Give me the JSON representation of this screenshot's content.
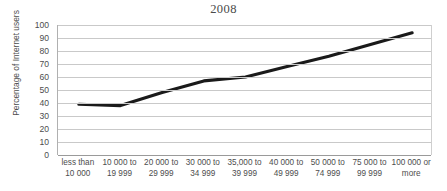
{
  "chart_data": {
    "type": "line",
    "title": "2008",
    "xlabel": "",
    "ylabel": "Percentage of Internet users",
    "categories": [
      "less than\n10 000",
      "10 000 to\n19 999",
      "20 000 to\n29 999",
      "30 000 to\n34 999",
      "35,000 to\n39 999",
      "40 000 to\n49 999",
      "50 000 to\n74 999",
      "75 000 to\n99 999",
      "100 000 or\nmore"
    ],
    "values": [
      39,
      38,
      48,
      57,
      60,
      68,
      76,
      85,
      94
    ],
    "ylim": [
      0,
      100
    ],
    "ytick_labels": [
      "0",
      "10",
      "20",
      "30",
      "40",
      "50",
      "60",
      "70",
      "80",
      "90",
      "100"
    ],
    "ytick_values": [
      0,
      10,
      20,
      30,
      40,
      50,
      60,
      70,
      80,
      90,
      100
    ],
    "grid": true,
    "legend": false,
    "legend_position": "none",
    "series_color": "#1a1a1a",
    "gridline_color": "#c9c9c9",
    "axis_color": "#9a9a9a",
    "background_color": "#ffffff"
  }
}
